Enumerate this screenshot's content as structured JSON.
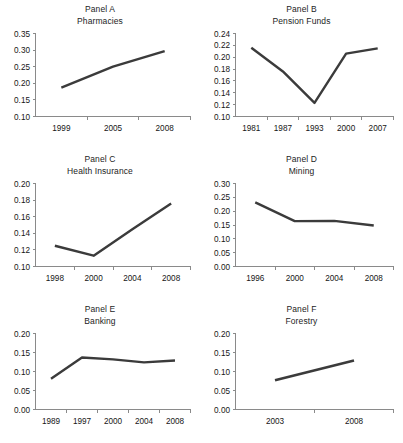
{
  "figure": {
    "background_color": "#ffffff",
    "series_color": "#3b3b3b",
    "axis_color": "#8a8a8a",
    "text_color": "#1a1a1a"
  },
  "chart_data": [
    {
      "type": "line",
      "panel_label": "Panel A",
      "title": "Pharmacies",
      "xlabel": "",
      "ylabel": "",
      "categories": [
        "1999",
        "2005",
        "2008"
      ],
      "values": [
        0.187,
        0.25,
        0.297
      ],
      "yticks": [
        "0.10",
        "0.15",
        "0.20",
        "0.25",
        "0.30",
        "0.35"
      ],
      "ytick_values": [
        0.1,
        0.15,
        0.2,
        0.25,
        0.3,
        0.35
      ],
      "ylim": [
        0.1,
        0.35
      ],
      "grid": false,
      "legend": "none"
    },
    {
      "type": "line",
      "panel_label": "Panel B",
      "title": "Pension Funds",
      "xlabel": "",
      "ylabel": "",
      "categories": [
        "1981",
        "1987",
        "1993",
        "2000",
        "2007"
      ],
      "values": [
        0.216,
        0.176,
        0.123,
        0.206,
        0.215
      ],
      "yticks": [
        "0.10",
        "0.12",
        "0.14",
        "0.16",
        "0.18",
        "0.20",
        "0.22",
        "0.24"
      ],
      "ytick_values": [
        0.1,
        0.12,
        0.14,
        0.16,
        0.18,
        0.2,
        0.22,
        0.24
      ],
      "ylim": [
        0.1,
        0.24
      ],
      "grid": false,
      "legend": "none"
    },
    {
      "type": "line",
      "panel_label": "Panel C",
      "title": "Health Insurance",
      "xlabel": "",
      "ylabel": "",
      "categories": [
        "1998",
        "2000",
        "2004",
        "2008"
      ],
      "values": [
        0.125,
        0.113,
        0.145,
        0.176
      ],
      "yticks": [
        "0.10",
        "0.12",
        "0.14",
        "0.16",
        "0.18",
        "0.20"
      ],
      "ytick_values": [
        0.1,
        0.12,
        0.14,
        0.16,
        0.18,
        0.2
      ],
      "ylim": [
        0.1,
        0.2
      ],
      "grid": false,
      "legend": "none"
    },
    {
      "type": "line",
      "panel_label": "Panel D",
      "title": "Mining",
      "xlabel": "",
      "ylabel": "",
      "categories": [
        "1996",
        "2000",
        "2004",
        "2008"
      ],
      "values": [
        0.232,
        0.164,
        0.165,
        0.148
      ],
      "yticks": [
        "0.00",
        "0.05",
        "0.10",
        "0.15",
        "0.20",
        "0.25",
        "0.30"
      ],
      "ytick_values": [
        0.0,
        0.05,
        0.1,
        0.15,
        0.2,
        0.25,
        0.3
      ],
      "ylim": [
        0.0,
        0.3
      ],
      "grid": false,
      "legend": "none"
    },
    {
      "type": "line",
      "panel_label": "Panel E",
      "title": "Banking",
      "xlabel": "",
      "ylabel": "",
      "categories": [
        "1989",
        "1997",
        "2000",
        "2004",
        "2008"
      ],
      "values": [
        0.081,
        0.137,
        0.132,
        0.124,
        0.129
      ],
      "yticks": [
        "0.00",
        "0.05",
        "0.10",
        "0.15",
        "0.20"
      ],
      "ytick_values": [
        0.0,
        0.05,
        0.1,
        0.15,
        0.2
      ],
      "ylim": [
        0.0,
        0.2
      ],
      "grid": false,
      "legend": "none"
    },
    {
      "type": "line",
      "panel_label": "Panel F",
      "title": "Forestry",
      "xlabel": "",
      "ylabel": "",
      "categories": [
        "2003",
        "2008"
      ],
      "values": [
        0.077,
        0.129
      ],
      "yticks": [
        "0.00",
        "0.05",
        "0.10",
        "0.15",
        "0.20"
      ],
      "ytick_values": [
        0.0,
        0.05,
        0.1,
        0.15,
        0.2
      ],
      "ylim": [
        0.0,
        0.2
      ],
      "grid": false,
      "legend": "none"
    }
  ]
}
